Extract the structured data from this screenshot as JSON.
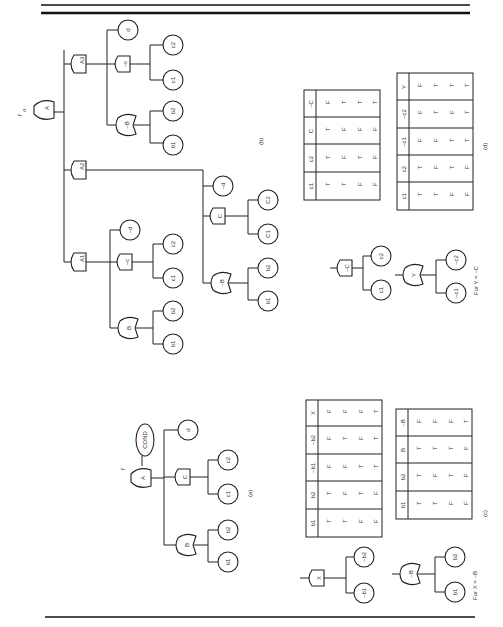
{
  "figure": {
    "top_label": "f_o",
    "panels": {
      "a": {
        "caption": "(a)",
        "root": "A",
        "cond": "COND",
        "gates": [
          "A",
          "B",
          "C"
        ],
        "events": [
          "b1",
          "b2",
          "c1",
          "c2",
          "d"
        ]
      },
      "b": {
        "caption": "(b)",
        "root": "A",
        "gates": [
          "A1",
          "A2",
          "A3",
          "B",
          "~B",
          "~C",
          "C",
          "~B"
        ],
        "events": [
          "b1",
          "b2",
          "c1",
          "c2",
          "~d",
          "b1",
          "b2",
          "C1",
          "C2",
          "~d",
          "b1",
          "b2",
          "c1",
          "c2",
          "d"
        ]
      },
      "c": {
        "caption": "(c)",
        "note": "For X = ~B"
      },
      "d": {
        "caption": "(d)",
        "note": "For Y = ~C"
      }
    },
    "small_trees": {
      "x_gate": "X",
      "x_inputs": [
        "~b1",
        "~b2"
      ],
      "nb_gate": "~B",
      "nb_inputs": [
        "b1",
        "b2"
      ],
      "nc_gate": "~C",
      "nc_inputs": [
        "c1",
        "c2"
      ],
      "y_gate": "Y",
      "y_inputs": [
        "~c1",
        "~c2"
      ]
    },
    "tables": {
      "c_left": {
        "headers": [
          "b1",
          "b2",
          "~b1",
          "~b2",
          "X"
        ],
        "rows": [
          [
            "F",
            "T",
            "T",
            "F",
            "F"
          ],
          [
            "F",
            "F",
            "T",
            "T",
            "F"
          ],
          [
            "T",
            "T",
            "F",
            "F",
            "F"
          ],
          [
            "T",
            "F",
            "F",
            "T",
            "T"
          ]
        ]
      },
      "c_right": {
        "headers": [
          "b1",
          "b2",
          "B",
          "~B"
        ],
        "rows": [
          [
            "T",
            "T",
            "T",
            "F"
          ],
          [
            "T",
            "F",
            "T",
            "F"
          ],
          [
            "F",
            "T",
            "T",
            "F"
          ],
          [
            "F",
            "F",
            "F",
            "T"
          ]
        ]
      },
      "b_table": {
        "headers": [
          "c1",
          "c2",
          "C",
          "~C"
        ],
        "rows": [
          [
            "T",
            "T",
            "T",
            "F"
          ],
          [
            "T",
            "F",
            "F",
            "T"
          ],
          [
            "F",
            "T",
            "F",
            "T"
          ],
          [
            "F",
            "F",
            "F",
            "T"
          ]
        ]
      },
      "d_table": {
        "headers": [
          "c1",
          "c2",
          "~c1",
          "~c2",
          "Y"
        ],
        "rows": [
          [
            "T",
            "T",
            "F",
            "F",
            "F"
          ],
          [
            "T",
            "F",
            "F",
            "T",
            "T"
          ],
          [
            "F",
            "T",
            "T",
            "F",
            "T"
          ],
          [
            "F",
            "F",
            "T",
            "T",
            "T"
          ]
        ]
      }
    }
  }
}
